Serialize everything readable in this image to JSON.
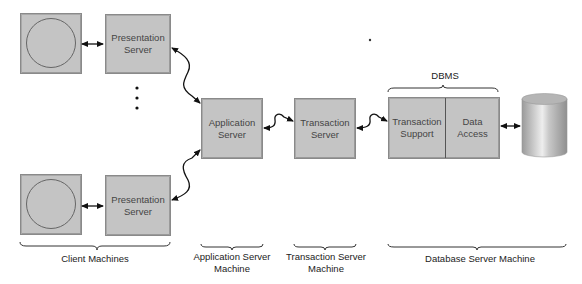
{
  "diagram": {
    "type": "three-tier transaction processing architecture",
    "clients": [
      {
        "id": "client-1",
        "presentation_label": [
          "Presentation",
          "Server"
        ]
      },
      {
        "id": "client-2",
        "presentation_label": [
          "Presentation",
          "Server"
        ]
      }
    ],
    "ellipsis": "⋮",
    "application_server": [
      "Application",
      "Server"
    ],
    "transaction_server": [
      "Transaction",
      "Server"
    ],
    "dbms": {
      "title": "DBMS",
      "transaction_support": [
        "Transaction",
        "Support"
      ],
      "data_access": [
        "Data",
        "Access"
      ]
    },
    "database_icon": "database-cylinder-icon",
    "group_labels": {
      "client": "Client Machines",
      "app_server": [
        "Application Server",
        "Machine"
      ],
      "tx_server": [
        "Transaction Server",
        "Machine"
      ],
      "db_server": "Database Server Machine"
    },
    "colors": {
      "box_fill": "#c4c4c4",
      "box_border": "#8a8a8a",
      "line": "#111111",
      "background": "#ffffff"
    }
  }
}
